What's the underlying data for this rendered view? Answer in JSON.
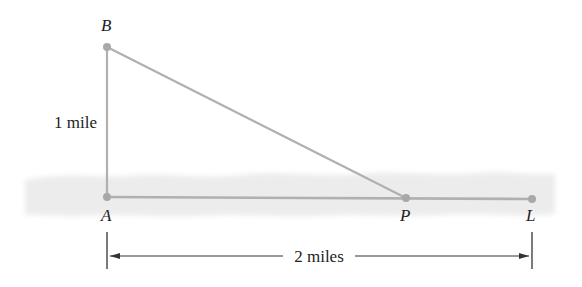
{
  "diagram": {
    "points": {
      "A": {
        "label": "A",
        "x": 107,
        "y": 197
      },
      "B": {
        "label": "B",
        "x": 107,
        "y": 47
      },
      "P": {
        "label": "P",
        "x": 406,
        "y": 198
      },
      "L": {
        "label": "L",
        "x": 532,
        "y": 199
      }
    },
    "labels": {
      "vertical_distance": "1 mile",
      "horizontal_distance": "2 miles"
    },
    "colors": {
      "segment": "#b0b0b0",
      "point": "#a8a8a8",
      "ground_band": "#ebebeb",
      "text": "#222222",
      "dimension_line": "#333333"
    }
  }
}
